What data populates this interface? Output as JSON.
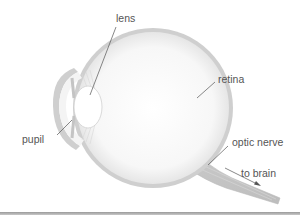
{
  "diagram": {
    "colors": {
      "outline": "#c6c6c6",
      "fill": "#f6f6f6",
      "leader": "#555555",
      "text": "#555555"
    },
    "labels": {
      "lens": "lens",
      "retina": "retina",
      "pupil": "pupil",
      "optic_nerve": "optic nerve",
      "to_brain": "to brain"
    }
  }
}
